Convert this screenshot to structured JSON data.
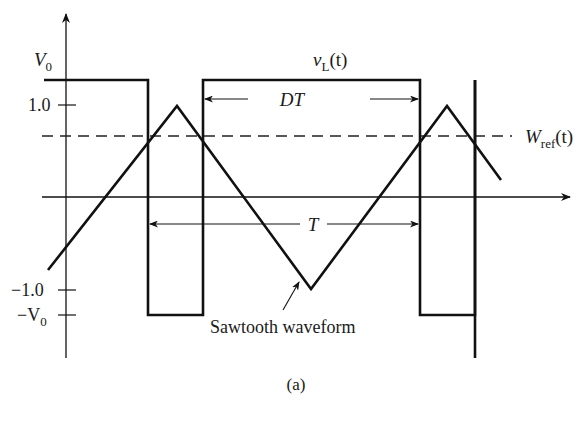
{
  "figure": {
    "caption": "(a)",
    "y_axis_labels": {
      "v0": "V",
      "v0_sub": "0",
      "one": "1.0",
      "neg_one": "−1.0",
      "neg_v0": "−V",
      "neg_v0_sub": "0"
    },
    "signals": {
      "vl": {
        "name": "v",
        "sub": "L",
        "arg": "(t)"
      },
      "wref": {
        "name": "W",
        "sub": "ref",
        "arg": "(t)"
      },
      "sawtooth_label": "Sawtooth waveform"
    },
    "intervals": {
      "dt_label": "DT",
      "t_label": "T"
    },
    "colors": {
      "line": "#111111",
      "background": "#ffffff"
    }
  }
}
